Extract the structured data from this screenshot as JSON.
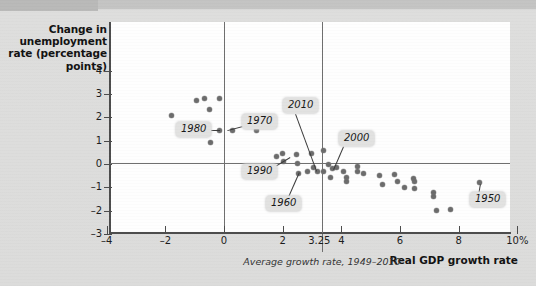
{
  "chart_data": {
    "type": "scatter",
    "title": "",
    "xlabel": "Real GDP growth rate",
    "ylabel": "Change in unemployment rate (percentage points)",
    "xlim": [
      -4,
      10
    ],
    "ylim": [
      -3,
      4.6
    ],
    "xticks": [
      "-4",
      "-2",
      "0",
      "2",
      "3.25",
      "4",
      "6",
      "8",
      "10%"
    ],
    "xtick_values": [
      -4,
      -2,
      0,
      2,
      3.25,
      4,
      6,
      8,
      10
    ],
    "yticks": [
      "4",
      "3",
      "2",
      "1",
      "0",
      "-1",
      "-2",
      "-3"
    ],
    "ytick_values": [
      4,
      3,
      2,
      1,
      0,
      -1,
      -2,
      -3
    ],
    "grid": false,
    "legend": false,
    "reference_lines": [
      {
        "axis": "y",
        "value": 0,
        "label": ""
      },
      {
        "axis": "x",
        "value": 0,
        "label": ""
      },
      {
        "axis": "x",
        "value": 3.25,
        "label": "Average growth rate, 1949-2010"
      }
    ],
    "annotations": [
      {
        "label": "1980",
        "x": 0.0,
        "y": 1.45
      },
      {
        "label": "1970",
        "x": 0.2,
        "y": 1.45
      },
      {
        "label": "2010",
        "x": 3.0,
        "y": -0.35
      },
      {
        "label": "2000",
        "x": 4.1,
        "y": 0.15
      },
      {
        "label": "1990",
        "x": 1.9,
        "y": 0.15
      },
      {
        "label": "1960",
        "x": 2.5,
        "y": -0.4
      },
      {
        "label": "1950",
        "x": 8.7,
        "y": -0.8
      }
    ],
    "points": [
      {
        "x": -1.8,
        "y": 2.06
      },
      {
        "x": -0.95,
        "y": 2.72
      },
      {
        "x": -0.65,
        "y": 2.8
      },
      {
        "x": -0.48,
        "y": 2.32
      },
      {
        "x": -0.17,
        "y": 2.8
      },
      {
        "x": -0.14,
        "y": 1.43
      },
      {
        "x": -0.45,
        "y": 0.92
      },
      {
        "x": 0.3,
        "y": 1.45
      },
      {
        "x": 1.1,
        "y": 1.45
      },
      {
        "x": 1.8,
        "y": 0.34
      },
      {
        "x": 1.98,
        "y": 0.43
      },
      {
        "x": 2.02,
        "y": 0.09
      },
      {
        "x": 2.46,
        "y": 0.39
      },
      {
        "x": 2.49,
        "y": 0.04
      },
      {
        "x": 2.53,
        "y": -0.39
      },
      {
        "x": 2.83,
        "y": -0.34
      },
      {
        "x": 2.97,
        "y": 0.47
      },
      {
        "x": 3.04,
        "y": -0.13
      },
      {
        "x": 3.18,
        "y": -0.34
      },
      {
        "x": 3.38,
        "y": 0.6
      },
      {
        "x": 3.38,
        "y": -0.34
      },
      {
        "x": 3.55,
        "y": 0.0
      },
      {
        "x": 3.69,
        "y": -0.21
      },
      {
        "x": 3.62,
        "y": -0.56
      },
      {
        "x": 3.82,
        "y": -0.17
      },
      {
        "x": 4.06,
        "y": -0.34
      },
      {
        "x": 4.16,
        "y": -0.56
      },
      {
        "x": 4.19,
        "y": -0.77
      },
      {
        "x": 4.54,
        "y": -0.09
      },
      {
        "x": 4.54,
        "y": -0.34
      },
      {
        "x": 4.74,
        "y": -0.39
      },
      {
        "x": 5.29,
        "y": -0.51
      },
      {
        "x": 5.39,
        "y": -0.86
      },
      {
        "x": 5.83,
        "y": -0.43
      },
      {
        "x": 5.9,
        "y": -0.77
      },
      {
        "x": 6.14,
        "y": -0.99
      },
      {
        "x": 6.48,
        "y": -1.07
      },
      {
        "x": 6.45,
        "y": -0.64
      },
      {
        "x": 6.51,
        "y": -0.77
      },
      {
        "x": 7.14,
        "y": -1.24
      },
      {
        "x": 7.14,
        "y": -1.41
      },
      {
        "x": 7.24,
        "y": -2.01
      },
      {
        "x": 7.71,
        "y": -1.93
      },
      {
        "x": 8.7,
        "y": -0.81
      }
    ]
  },
  "axis_titles": {
    "y_line1": "Change in",
    "y_line2": "unemployment",
    "y_line3": "rate (percentage",
    "y_line4": "points)",
    "x": "Real GDP growth rate",
    "avg_caption": "Average growth rate, 1949–2010"
  },
  "ticks": {
    "y": [
      "4",
      "3",
      "2",
      "1",
      "0",
      "–1",
      "–2",
      "–3"
    ],
    "x": [
      "–4",
      "–2",
      "0",
      "2",
      "3.25",
      "4",
      "6",
      "8",
      "10%"
    ]
  },
  "callouts": {
    "c1980": "1980",
    "c1970": "1970",
    "c2010": "2010",
    "c2000": "2000",
    "c1990": "1990",
    "c1960": "1960",
    "c1950": "1950"
  },
  "colors": {
    "background": "#dededd",
    "plot_bg": "#fefefe",
    "axis": "#4b4b4b",
    "point": "#6b6b6b",
    "callout_bg": "#e2e2e1",
    "text": "#161616"
  }
}
